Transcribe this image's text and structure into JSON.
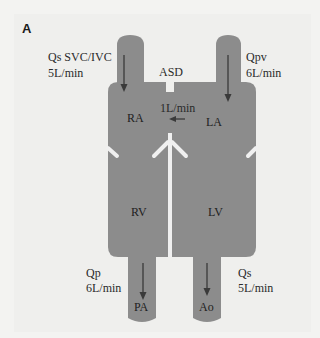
{
  "figure": {
    "panel_label": "A",
    "colors": {
      "background": "#efefed",
      "chamber_fill": "#8c8c8c",
      "septum": "#f0f0f0",
      "arrow": "#3a3a3a",
      "text": "#2a2a2a"
    }
  },
  "inflows": {
    "systemic_venous": {
      "label": "Qs  SVC/IVC",
      "flow": "5L/min"
    },
    "pulmonary_venous": {
      "label": "Qpv",
      "flow": "6L/min"
    }
  },
  "shunt": {
    "defect": "ASD",
    "flow": "1L/min",
    "direction": "left-to-right"
  },
  "chambers": {
    "ra": "RA",
    "la": "LA",
    "rv": "RV",
    "lv": "LV"
  },
  "outflows": {
    "pulmonary": {
      "label": "Qp",
      "flow": "6L/min",
      "vessel": "PA"
    },
    "systemic": {
      "label": "Qs",
      "flow": "5L/min",
      "vessel": "Ao"
    }
  }
}
